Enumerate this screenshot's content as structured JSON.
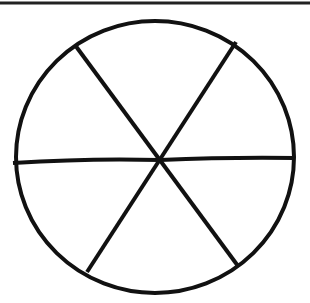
{
  "diagram": {
    "sections": 6,
    "stroke_color": "#111111",
    "background": "#ffffff"
  }
}
